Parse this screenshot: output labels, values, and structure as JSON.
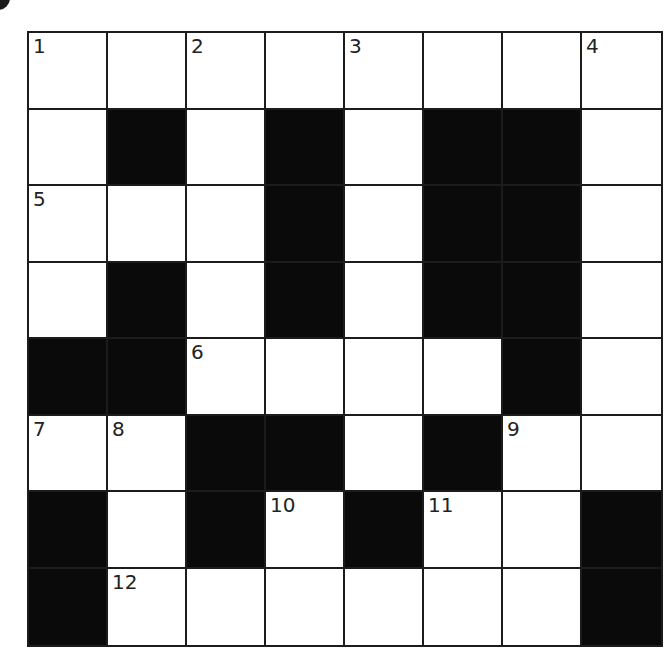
{
  "puzzle": {
    "type": "crossword",
    "rows": 8,
    "cols": 8,
    "layout": [
      "WWWWWWWW",
      "WBWBWBBW",
      "WWWBWBBW",
      "WBWBWBBW",
      "BBWWWWBW",
      "WWBBWBWW",
      "BWBWBWWB",
      "BWWWWWWB"
    ],
    "numbers": [
      {
        "row": 0,
        "col": 0,
        "label": "1"
      },
      {
        "row": 0,
        "col": 2,
        "label": "2"
      },
      {
        "row": 0,
        "col": 4,
        "label": "3"
      },
      {
        "row": 0,
        "col": 7,
        "label": "4"
      },
      {
        "row": 2,
        "col": 0,
        "label": "5"
      },
      {
        "row": 4,
        "col": 2,
        "label": "6"
      },
      {
        "row": 5,
        "col": 0,
        "label": "7"
      },
      {
        "row": 5,
        "col": 1,
        "label": "8"
      },
      {
        "row": 5,
        "col": 6,
        "label": "9"
      },
      {
        "row": 6,
        "col": 3,
        "label": "10"
      },
      {
        "row": 6,
        "col": 5,
        "label": "11"
      },
      {
        "row": 7,
        "col": 1,
        "label": "12"
      }
    ],
    "colors": {
      "block": "#0a0a0a",
      "cell": "#ffffff",
      "line": "#1c1c1c",
      "number": "#222222"
    }
  }
}
